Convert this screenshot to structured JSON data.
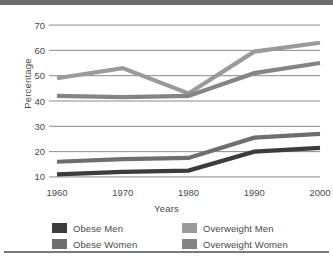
{
  "chart_data": {
    "type": "line",
    "title": "",
    "xlabel": "Years",
    "ylabel": "Percentage",
    "x": [
      1960,
      1970,
      1980,
      1990,
      2000
    ],
    "categories": [
      "1960",
      "1970",
      "1980",
      "1990",
      "2000"
    ],
    "xticklabels": [
      "1960",
      "1970",
      "1980",
      "1990",
      "2000"
    ],
    "yticklabels": [
      "10",
      "20",
      "30",
      "40",
      "50",
      "60",
      "70"
    ],
    "yticks": [
      10,
      20,
      30,
      40,
      50,
      60,
      70
    ],
    "ylim": [
      8,
      72
    ],
    "xlim": [
      1955,
      2005
    ],
    "grid": "horizontal",
    "legend_position": "bottom",
    "series": [
      {
        "name": "Obese Men",
        "color": "#3c3c3c",
        "values": [
          11,
          12,
          12.5,
          20,
          21.5
        ]
      },
      {
        "name": "Obese Women",
        "color": "#6e6e6e",
        "values": [
          16,
          17,
          17.5,
          25.5,
          27
        ]
      },
      {
        "name": "Overweight Men",
        "color": "#9a9a9a",
        "values": [
          49,
          53,
          43,
          59.5,
          63
        ]
      },
      {
        "name": "Overweight Women",
        "color": "#848484",
        "values": [
          42,
          41.5,
          42,
          51,
          55
        ]
      }
    ]
  },
  "legend": {
    "items": [
      {
        "label": "Obese Men",
        "color": "#3c3c3c"
      },
      {
        "label": "Overweight Men",
        "color": "#9a9a9a"
      },
      {
        "label": "Obese Women",
        "color": "#6e6e6e"
      },
      {
        "label": "Overweight Women",
        "color": "#848484"
      }
    ]
  },
  "style": {
    "grid_color": "#8a8a8a",
    "text_color": "#4a4a4a",
    "top_bar_color": "#6b6b6b",
    "bottom_rule_color": "#7a7a7a",
    "background": "#ffffff"
  }
}
